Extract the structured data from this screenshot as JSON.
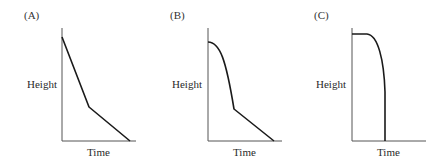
{
  "figure": {
    "panels": [
      {
        "id": "A",
        "label": "(A)",
        "ylabel": "Height",
        "xlabel": "Time",
        "description": "Steep linear decrease, then a kink to a shallower linear decrease reaching zero",
        "path": "M62,37 L89,107 L130,141"
      },
      {
        "id": "B",
        "label": "(B)",
        "ylabel": "Height",
        "xlabel": "Time",
        "description": "Curved (accelerating) decrease from rounded top, then kink to shallow linear decrease reaching zero",
        "path": "M208,42 C220,42 226,60 234,109 L274,141"
      },
      {
        "id": "C",
        "label": "(C)",
        "ylabel": "Height",
        "xlabel": "Time",
        "description": "Flat plateau, then rounded drop becoming a vertical fall to zero",
        "path": "M352,34 L367,34 C378,35 384,60 385,92 L385,141"
      }
    ]
  }
}
